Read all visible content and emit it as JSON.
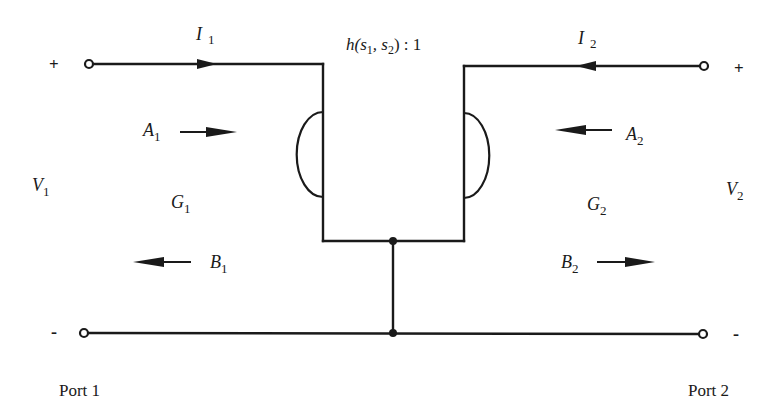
{
  "diagram": {
    "transformer_label": {
      "base": "h(s",
      "s1_sub": "1",
      "sep": ", s",
      "s2_sub": "2",
      "tail": ") : 1"
    },
    "ports": {
      "port1": {
        "label": "Port 1",
        "plus": "+",
        "minus": "-",
        "voltage": {
          "base": "V",
          "sub": "1"
        },
        "current": {
          "base": "I",
          "sub": "1",
          "direction": "right"
        },
        "incident_wave": {
          "base": "A",
          "sub": "1",
          "direction": "right"
        },
        "reflected_wave": {
          "base": "B",
          "sub": "1",
          "direction": "left"
        },
        "conductance": {
          "base": "G",
          "sub": "1"
        }
      },
      "port2": {
        "label": "Port 2",
        "plus": "+",
        "minus": "-",
        "voltage": {
          "base": "V",
          "sub": "2"
        },
        "current": {
          "base": "I",
          "sub": "2",
          "direction": "left"
        },
        "incident_wave": {
          "base": "A",
          "sub": "2",
          "direction": "left"
        },
        "reflected_wave": {
          "base": "B",
          "sub": "2",
          "direction": "right"
        },
        "conductance": {
          "base": "G",
          "sub": "2"
        }
      }
    },
    "colors": {
      "ink": "#1a1a1a",
      "background": "#ffffff"
    }
  }
}
